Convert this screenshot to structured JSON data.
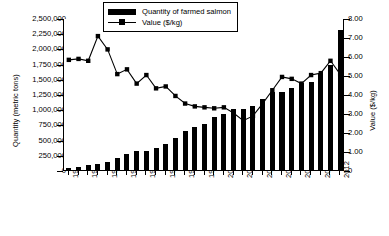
{
  "chart_data": {
    "type": "bar",
    "title": "",
    "xlabel": "",
    "ylabel": "Quantity (metric tons)",
    "y2label": "Value ($/kg)",
    "ylim": [
      0,
      2500000
    ],
    "y2lim": [
      0,
      8.0
    ],
    "grid": false,
    "legend_position": "top-center-inside",
    "x": [
      1984,
      1985,
      1986,
      1987,
      1988,
      1989,
      1990,
      1991,
      1992,
      1993,
      1994,
      1995,
      1996,
      1997,
      1998,
      1999,
      2000,
      2001,
      2002,
      2003,
      2004,
      2005,
      2006,
      2007,
      2008,
      2009,
      2010,
      2011,
      2012
    ],
    "categories": [
      "1984",
      "1985",
      "1986",
      "1987",
      "1988",
      "1989",
      "1990",
      "1991",
      "1992",
      "1993",
      "1994",
      "1995",
      "1996",
      "1997",
      "1998",
      "1999",
      "2000",
      "2001",
      "2002",
      "2003",
      "2004",
      "2005",
      "2006",
      "2007",
      "2008",
      "2009",
      "2010",
      "2011",
      "2012"
    ],
    "tick_labels_x": [
      "1984",
      "1986",
      "1988",
      "1990",
      "1992",
      "1994",
      "1996",
      "1998",
      "2000",
      "2002",
      "2004",
      "2006",
      "2008",
      "2010",
      "2012"
    ],
    "tick_labels_y_left": [
      "0",
      "250,000",
      "500,000",
      "750,000",
      "1,000,000",
      "1,250,000",
      "1,500,000",
      "1,750,000",
      "2,000,000",
      "2,250,000",
      "2,500,000"
    ],
    "tick_labels_y_right": [
      "0",
      "1.00",
      "2.00",
      "3.00",
      "4.00",
      "5.00",
      "6.00",
      "7.00",
      "8.00"
    ],
    "series": [
      {
        "name": "Quantity of farmed salmon",
        "axis": "left",
        "type": "bar",
        "color": "#000000",
        "unit": "metric tons",
        "values": [
          25000,
          50000,
          75000,
          100000,
          140000,
          205000,
          270000,
          320000,
          310000,
          360000,
          430000,
          530000,
          635000,
          700000,
          755000,
          880000,
          920000,
          1000000,
          1000000,
          1060000,
          1170000,
          1285000,
          1280000,
          1350000,
          1430000,
          1450000,
          1580000,
          1720000,
          2300000
        ]
      },
      {
        "name": "Value ($/kg)",
        "axis": "right",
        "type": "line",
        "color": "#000000",
        "marker": "square",
        "unit": "$/kg",
        "values": [
          5.85,
          5.9,
          5.8,
          7.1,
          6.4,
          5.1,
          5.35,
          4.6,
          5.05,
          4.35,
          4.45,
          3.95,
          3.55,
          3.4,
          3.35,
          3.3,
          3.35,
          3.05,
          2.65,
          2.9,
          3.55,
          4.25,
          4.95,
          4.85,
          4.6,
          5.05,
          5.15,
          5.8,
          5.1
        ]
      }
    ]
  },
  "legend": {
    "items": [
      {
        "label": "Quantity of farmed salmon",
        "marker": "bar"
      },
      {
        "label": "Value ($/kg)",
        "marker": "line-square"
      }
    ]
  },
  "axes": {
    "left_title": "Quantity (metric tons)",
    "right_title": "Value ($/kg)"
  }
}
